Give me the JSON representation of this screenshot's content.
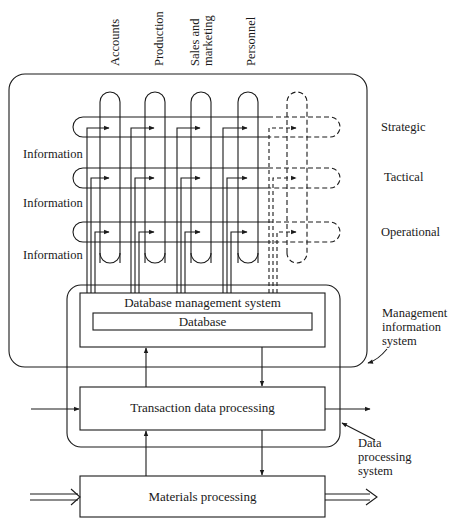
{
  "diagram": {
    "functions": [
      {
        "label": "Accounts"
      },
      {
        "label": "Production"
      },
      {
        "label": "Sales and marketing",
        "lines": [
          "Sales and",
          "marketing"
        ]
      },
      {
        "label": "Personnel"
      }
    ],
    "levels": [
      {
        "label": "Strategic"
      },
      {
        "label": "Tactical"
      },
      {
        "label": "Operational"
      }
    ],
    "information_labels": [
      "Information",
      "Information",
      "Information"
    ],
    "dbms": {
      "label": "Database management system"
    },
    "database": {
      "label": "Database"
    },
    "transaction": {
      "label": "Transaction data processing"
    },
    "materials": {
      "label": "Materials processing"
    },
    "mis_label": {
      "lines": [
        "Management",
        "information",
        "system"
      ]
    },
    "dps_label": {
      "lines": [
        "Data",
        "processing",
        "system"
      ]
    },
    "colors": {
      "stroke": "#1a1a1a",
      "background": "#ffffff"
    }
  }
}
